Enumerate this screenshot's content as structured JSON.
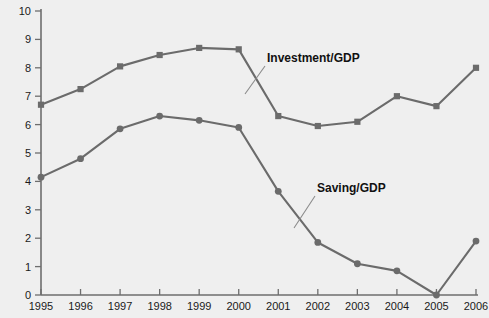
{
  "chart_data": {
    "type": "line",
    "title": "",
    "subtitle": "",
    "xlabel": "",
    "ylabel": "Percent of GDP",
    "x": [
      1995,
      1996,
      1997,
      1998,
      1999,
      2000,
      2001,
      2002,
      2003,
      2004,
      2005,
      2006
    ],
    "categories": [
      "1995",
      "1996",
      "1997",
      "1998",
      "1999",
      "2000",
      "2001",
      "2002",
      "2003",
      "2004",
      "2005",
      "2006"
    ],
    "xlim": [
      1995,
      2006
    ],
    "ylim": [
      0,
      10
    ],
    "yticks": [
      0,
      1,
      2,
      3,
      4,
      5,
      6,
      7,
      8,
      9,
      10
    ],
    "ytick_labels": [
      "0",
      "1",
      "2",
      "3",
      "4",
      "5",
      "6",
      "7",
      "8",
      "9",
      "10"
    ],
    "xticks": [
      1995,
      1996,
      1997,
      1998,
      1999,
      2000,
      2001,
      2002,
      2003,
      2004,
      2005,
      2006
    ],
    "xtick_labels": [
      "1995",
      "1996",
      "1997",
      "1998",
      "1999",
      "2000",
      "2001",
      "2002",
      "2003",
      "2004",
      "2005",
      "2006"
    ],
    "grid": false,
    "legend_position": "inline-annotation",
    "series": [
      {
        "name": "Investment/GDP",
        "marker": "square",
        "color": "#6b6b6b",
        "values": [
          6.7,
          7.25,
          8.05,
          8.45,
          8.7,
          8.65,
          6.3,
          5.95,
          6.1,
          7.0,
          6.65,
          8.0
        ]
      },
      {
        "name": "Saving/GDP",
        "marker": "circle",
        "color": "#6b6b6b",
        "values": [
          4.15,
          4.8,
          5.85,
          6.3,
          6.15,
          5.9,
          3.65,
          1.85,
          1.1,
          0.85,
          0.0,
          1.9
        ]
      }
    ],
    "annotations": [
      {
        "text": "Investment/GDP",
        "series": "Investment/GDP"
      },
      {
        "text": "Saving/GDP",
        "series": "Saving/GDP"
      }
    ]
  },
  "axis": {
    "y_title": "Percent of GDP"
  },
  "labels": {
    "investment": "Investment/GDP",
    "saving": "Saving/GDP"
  }
}
